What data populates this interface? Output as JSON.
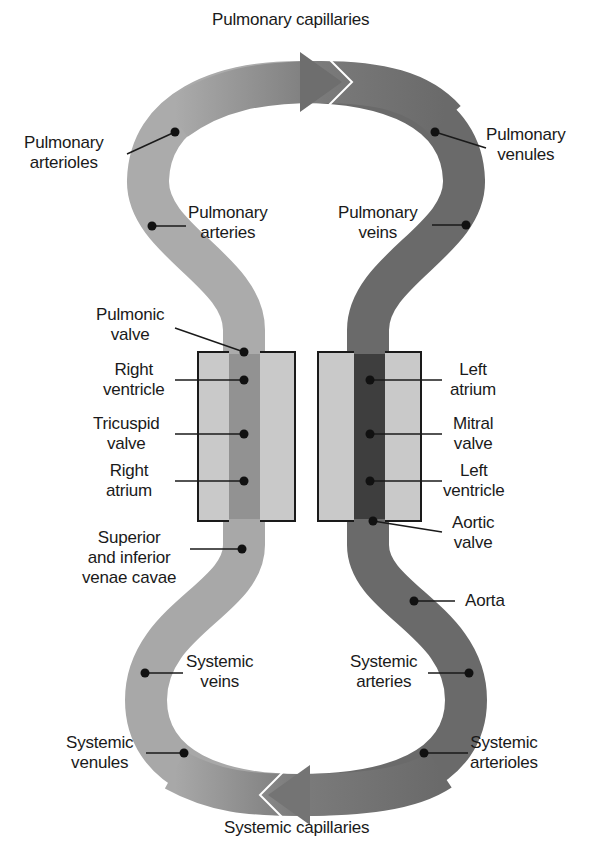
{
  "colors": {
    "venous": "#a8a8a8",
    "arterial": "#6a6a6a",
    "arterial_dark": "#3e3e3e",
    "venous_heart": "#8a8a8a",
    "heart_box": "#c9c9c9",
    "outline": "#1a1a1a",
    "dot": "#111111"
  },
  "labels": {
    "pulmonary_capillaries": "Pulmonary capillaries",
    "pulmonary_arterioles": "Pulmonary\narterioles",
    "pulmonary_venules": "Pulmonary\nvenules",
    "pulmonary_arteries": "Pulmonary\narteries",
    "pulmonary_veins": "Pulmonary\nveins",
    "pulmonic_valve": "Pulmonic\nvalve",
    "right_ventricle": "Right\nventricle",
    "tricuspid_valve": "Tricuspid\nvalve",
    "right_atrium": "Right\natrium",
    "venae_cavae": "Superior\nand inferior\nvenae cavae",
    "left_atrium": "Left\natrium",
    "mitral_valve": "Mitral\nvalve",
    "left_ventricle": "Left\nventricle",
    "aortic_valve": "Aortic\nvalve",
    "aorta": "Aorta",
    "systemic_veins": "Systemic\nveins",
    "systemic_arteries": "Systemic\narteries",
    "systemic_venules": "Systemic\nvenules",
    "systemic_arterioles": "Systemic\narterioles",
    "systemic_capillaries": "Systemic capillaries"
  }
}
